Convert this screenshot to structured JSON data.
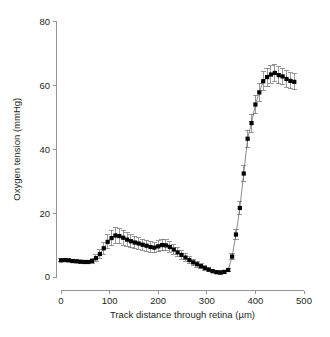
{
  "chart_data": {
    "type": "line",
    "title": "",
    "subtitle": "",
    "xlabel": "Track distance through retina (µm)",
    "ylabel": "Oxygen tension (mmHg)",
    "xlim": [
      0,
      500
    ],
    "ylim": [
      0,
      80
    ],
    "xticks": [
      0,
      100,
      200,
      300,
      400,
      500
    ],
    "yticks": [
      0,
      20,
      40,
      60,
      80
    ],
    "xtick_labels": [
      "0",
      "100",
      "200",
      "300",
      "400",
      "500"
    ],
    "ytick_labels": [
      "0",
      "20",
      "40",
      "60",
      "80"
    ],
    "grid": false,
    "legend": null,
    "marker": "filled-square",
    "error_bars": "vertical-capped",
    "series": [
      {
        "name": "Oxygen tension profile",
        "x": [
          0,
          8,
          16,
          24,
          32,
          40,
          48,
          56,
          64,
          72,
          80,
          88,
          96,
          104,
          112,
          120,
          128,
          136,
          144,
          152,
          160,
          168,
          176,
          184,
          192,
          200,
          208,
          216,
          224,
          232,
          240,
          248,
          256,
          264,
          272,
          280,
          288,
          296,
          304,
          312,
          320,
          328,
          336,
          344,
          352,
          360,
          368,
          376,
          384,
          392,
          400,
          408,
          416,
          424,
          432,
          440,
          448,
          456,
          464,
          472,
          480
        ],
        "y": [
          5.2,
          5.3,
          5.2,
          5.0,
          4.9,
          4.8,
          4.7,
          4.7,
          5.0,
          5.9,
          7.2,
          9.0,
          11.0,
          12.2,
          13.0,
          12.8,
          12.3,
          11.7,
          11.2,
          10.8,
          10.5,
          10.1,
          9.8,
          9.4,
          9.2,
          9.6,
          10.0,
          9.9,
          9.4,
          8.6,
          7.7,
          6.9,
          6.1,
          5.3,
          4.6,
          4.0,
          3.4,
          2.8,
          2.3,
          1.8,
          1.5,
          1.4,
          1.6,
          2.2,
          6.4,
          13.3,
          21.6,
          32.4,
          43.3,
          48.2,
          54.0,
          57.8,
          61.3,
          62.6,
          63.4,
          63.9,
          63.2,
          62.8,
          62.0,
          61.4,
          61.1
        ],
        "yerr": [
          0.5,
          0.5,
          0.5,
          0.5,
          0.5,
          0.5,
          0.5,
          0.6,
          0.8,
          1.0,
          1.4,
          1.8,
          2.2,
          2.4,
          2.5,
          2.4,
          2.3,
          2.1,
          2.0,
          1.9,
          1.8,
          1.7,
          1.7,
          1.6,
          1.6,
          1.7,
          1.8,
          1.7,
          1.6,
          1.5,
          1.4,
          1.3,
          1.2,
          1.1,
          1.0,
          0.9,
          0.8,
          0.7,
          0.6,
          0.5,
          0.5,
          0.5,
          0.5,
          0.6,
          1.0,
          1.5,
          2.0,
          2.4,
          2.7,
          2.8,
          2.9,
          2.9,
          2.9,
          2.8,
          2.8,
          2.7,
          2.7,
          2.6,
          2.6,
          2.5,
          2.5
        ]
      }
    ]
  },
  "style": {
    "marker_color": "#000000",
    "line_color": "#58595b",
    "axis_color": "#939598",
    "text_color": "#231f20",
    "background": "#ffffff"
  }
}
